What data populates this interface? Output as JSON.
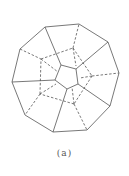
{
  "figure": {
    "caption": "(a)",
    "stroke_color": "#555555",
    "solid_edges": [
      [
        45,
        27,
        79,
        24
      ],
      [
        79,
        24,
        108,
        42
      ],
      [
        108,
        42,
        119,
        73
      ],
      [
        119,
        73,
        110,
        106
      ],
      [
        110,
        106,
        87,
        130
      ],
      [
        87,
        130,
        53,
        132
      ],
      [
        53,
        132,
        25,
        115
      ],
      [
        25,
        115,
        12,
        82
      ],
      [
        12,
        82,
        20,
        49
      ],
      [
        20,
        49,
        45,
        27
      ],
      [
        61,
        65,
        76,
        69
      ],
      [
        76,
        69,
        78,
        84
      ],
      [
        78,
        84,
        67,
        89
      ],
      [
        67,
        89,
        55,
        80
      ],
      [
        55,
        80,
        61,
        65
      ],
      [
        61,
        65,
        45,
        27
      ],
      [
        76,
        69,
        108,
        42
      ],
      [
        78,
        84,
        110,
        106
      ],
      [
        67,
        89,
        53,
        132
      ],
      [
        55,
        80,
        12,
        82
      ]
    ],
    "dashed_edges": [
      [
        20,
        49,
        41,
        59
      ],
      [
        41,
        59,
        73,
        48
      ],
      [
        73,
        48,
        79,
        24
      ],
      [
        73,
        48,
        92,
        76
      ],
      [
        92,
        76,
        119,
        73
      ],
      [
        92,
        76,
        74,
        104
      ],
      [
        74,
        104,
        87,
        130
      ],
      [
        74,
        104,
        40,
        94
      ],
      [
        40,
        94,
        25,
        115
      ],
      [
        40,
        94,
        41,
        59
      ],
      [
        41,
        59,
        58,
        72
      ],
      [
        73,
        48,
        76,
        66
      ],
      [
        92,
        76,
        80,
        78
      ],
      [
        74,
        104,
        72,
        87
      ],
      [
        40,
        94,
        56,
        84
      ]
    ]
  }
}
